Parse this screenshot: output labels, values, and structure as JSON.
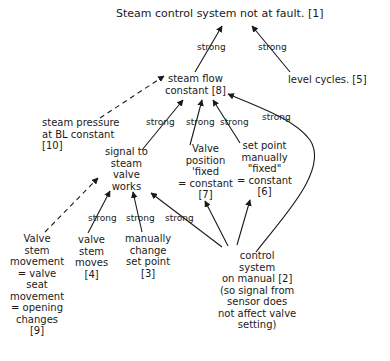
{
  "diagram": {
    "nodes": {
      "n1": {
        "id": 1,
        "text": "Steam control system not at fault. [1]"
      },
      "n5": {
        "id": 5,
        "text": "level cycles. [5]"
      },
      "n8": {
        "id": 8,
        "text": "steam flow\nconstant [8]"
      },
      "n10": {
        "id": 10,
        "text": "steam pressure\nat BL constant\n[10]"
      },
      "sv": {
        "text": "signal to\nsteam\nvalve\nworks"
      },
      "n7": {
        "id": 7,
        "text": "Valve\nposition\n'fixed\n= constant\n[7]"
      },
      "n6": {
        "id": 6,
        "text": "set point\nmanually\n\"fixed\"\n= constant\n[6]"
      },
      "n9": {
        "id": 9,
        "text": "Valve\nstem\nmovement\n= valve\nseat\nmovement\n= opening\nchanges\n[9]"
      },
      "n4": {
        "id": 4,
        "text": "valve\nstem\nmoves\n[4]"
      },
      "n3": {
        "id": 3,
        "text": "manually\nchange\nset point\n[3]"
      },
      "n2": {
        "id": 2,
        "text": "control\nsystem\non manual [2]\n(so signal from\nsensor does\nnot affect valve\nsetting)"
      }
    },
    "edge_labels": {
      "strong": "strong"
    },
    "edges": [
      {
        "from": 8,
        "to": 1,
        "label": "strong",
        "style": "solid"
      },
      {
        "from": 5,
        "to": 1,
        "label": "strong",
        "style": "solid"
      },
      {
        "from": 10,
        "to": 8,
        "label": "",
        "style": "dashed"
      },
      {
        "from": "sv",
        "to": 8,
        "label": "strong",
        "style": "solid"
      },
      {
        "from": 7,
        "to": 8,
        "label": "strong",
        "style": "solid"
      },
      {
        "from": 6,
        "to": 8,
        "label": "strong",
        "style": "solid"
      },
      {
        "from": 2,
        "to": 8,
        "label": "strong",
        "style": "solid"
      },
      {
        "from": 9,
        "to": "sv",
        "label": "",
        "style": "dashed"
      },
      {
        "from": 4,
        "to": "sv",
        "label": "strong",
        "style": "solid"
      },
      {
        "from": 3,
        "to": "sv",
        "label": "strong",
        "style": "solid"
      },
      {
        "from": 2,
        "to": "sv",
        "label": "strong",
        "style": "solid"
      },
      {
        "from": 2,
        "to": 7,
        "label": "",
        "style": "solid"
      },
      {
        "from": 2,
        "to": 6,
        "label": "",
        "style": "solid"
      }
    ]
  }
}
